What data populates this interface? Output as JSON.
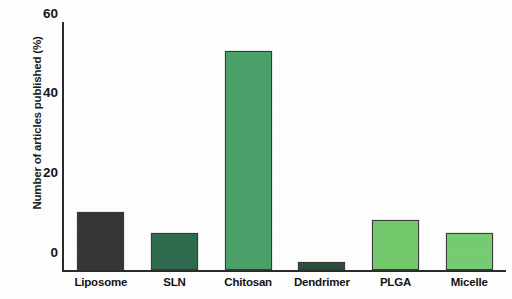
{
  "chart_data": {
    "type": "bar",
    "title": "",
    "xlabel": "",
    "ylabel": "Number of articles published (%)",
    "categories": [
      "Liposome",
      "SLN",
      "Chitosan",
      "Dendrimer",
      "PLGA",
      "Micelle"
    ],
    "values": [
      14,
      9,
      53,
      2,
      12,
      9
    ],
    "ylim": [
      0,
      60
    ],
    "yticks": [
      0,
      20,
      40,
      60
    ],
    "ytick_labels": [
      "0",
      "20",
      "40",
      "60"
    ],
    "grid": false,
    "legend": null,
    "bar_colors": [
      "#343733",
      "#2f6b4f",
      "#4ba169",
      "#2c4f3c",
      "#72c86a",
      "#76cc72"
    ],
    "bar_edge_color": "#3a3a3a"
  },
  "axes": {
    "y_axis_title": "Number of articles published (%)",
    "y_tick_values": [
      "60",
      "40",
      "20",
      "0"
    ]
  },
  "categories_detail": [
    {
      "label": "Liposome",
      "value": 14,
      "color": "#343733"
    },
    {
      "label": "SLN",
      "value": 9,
      "color": "#2f6b4f"
    },
    {
      "label": "Chitosan",
      "value": 53,
      "color": "#4ba169"
    },
    {
      "label": "Dendrimer",
      "value": 2,
      "color": "#2c4f3c"
    },
    {
      "label": "PLGA",
      "value": 12,
      "color": "#72c86a"
    },
    {
      "label": "Micelle",
      "value": 9,
      "color": "#76cc72"
    }
  ]
}
